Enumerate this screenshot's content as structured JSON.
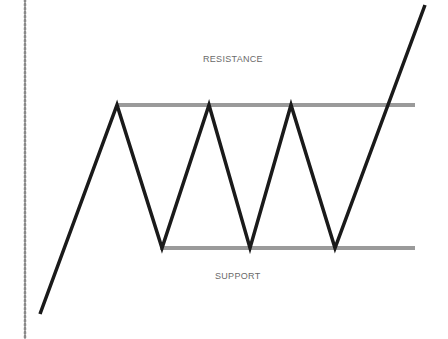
{
  "diagram": {
    "labels": {
      "resistance": "RESISTANCE",
      "support": "SUPPORT"
    },
    "colors": {
      "price_line": "#1a1a1a",
      "level_line": "#9a9a9a",
      "dotted_axis": "#8a8a8a",
      "label_text": "#6a6a6a"
    },
    "price_path": [
      [
        40,
        314
      ],
      [
        117,
        105
      ],
      [
        162,
        248
      ],
      [
        209,
        105
      ],
      [
        250,
        248
      ],
      [
        291,
        105
      ],
      [
        335,
        248
      ],
      [
        425,
        5
      ]
    ],
    "resistance_line": {
      "x1": 117,
      "y1": 105,
      "x2": 415,
      "y2": 105
    },
    "support_line": {
      "x1": 160,
      "y1": 248,
      "x2": 415,
      "y2": 248
    }
  }
}
